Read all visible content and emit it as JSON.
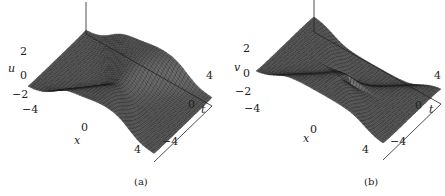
{
  "figure": {
    "panels": [
      {
        "id": "a",
        "caption": "(a)",
        "zlabel": "u",
        "xlabel": "x",
        "tlabel": "t",
        "z_ticks": [
          "2",
          "0",
          "−2"
        ],
        "x_ticks": [
          "−4",
          "0",
          "4"
        ],
        "t_ticks": [
          "4",
          "0",
          "−4"
        ]
      },
      {
        "id": "b",
        "caption": "(b)",
        "zlabel": "v",
        "xlabel": "x",
        "tlabel": "t",
        "z_ticks": [
          "2",
          "0",
          "−2"
        ],
        "x_ticks": [
          "−4",
          "0",
          "4"
        ],
        "t_ticks": [
          "4",
          "0",
          "−4"
        ]
      }
    ]
  },
  "chart_data": [
    {
      "type": "surface",
      "title": "(a)",
      "xlabel": "x",
      "ylabel": "t",
      "zlabel": "u",
      "xlim": [
        -5,
        5
      ],
      "ylim": [
        -5,
        5
      ],
      "zlim": [
        -2,
        2
      ],
      "x_ticks": [
        -4,
        0,
        4
      ],
      "y_ticks": [
        -4,
        0,
        4
      ],
      "z_ticks": [
        -2,
        0,
        2
      ]
    },
    {
      "type": "surface",
      "title": "(b)",
      "xlabel": "x",
      "ylabel": "t",
      "zlabel": "v",
      "xlim": [
        -5,
        5
      ],
      "ylim": [
        -5,
        5
      ],
      "zlim": [
        -2,
        2
      ],
      "x_ticks": [
        -4,
        0,
        4
      ],
      "y_ticks": [
        -4,
        0,
        4
      ],
      "z_ticks": [
        -2,
        0,
        2
      ]
    }
  ]
}
